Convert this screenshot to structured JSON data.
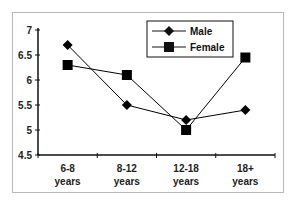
{
  "chart_data": {
    "type": "line",
    "title": "",
    "xlabel": "",
    "ylabel": "",
    "categories": [
      "6-8 years",
      "8-12 years",
      "12-18 years",
      "18+ years"
    ],
    "category_lines": [
      [
        "6-8",
        "years"
      ],
      [
        "8-12",
        "years"
      ],
      [
        "12-18",
        "years"
      ],
      [
        "18+",
        "years"
      ]
    ],
    "series": [
      {
        "name": "Male",
        "marker": "diamond",
        "color": "#000000",
        "values": [
          6.7,
          5.5,
          5.2,
          5.4
        ]
      },
      {
        "name": "Female",
        "marker": "square",
        "color": "#000000",
        "values": [
          6.3,
          6.1,
          5.0,
          6.45
        ]
      }
    ],
    "ylim": [
      4.5,
      7
    ],
    "yticks": [
      "4.5",
      "5",
      "5.5",
      "6",
      "6.5",
      "7"
    ],
    "grid": false,
    "legend_position": "top-right-inside"
  }
}
